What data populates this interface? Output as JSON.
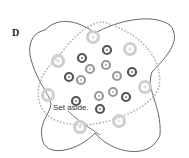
{
  "panel": {
    "label": "D"
  },
  "annotation": {
    "text": "Set aside."
  },
  "colors": {
    "outline": "#555555",
    "dotted": "#b5b5b5",
    "dark": "#555555",
    "medium": "#9a9a9a",
    "light": "#cfcfcf"
  },
  "circles": [
    {
      "x": 93,
      "y": 37,
      "r": 5.5,
      "tone": "light"
    },
    {
      "x": 130,
      "y": 49,
      "r": 5.5,
      "tone": "light"
    },
    {
      "x": 58,
      "y": 61,
      "r": 5.5,
      "tone": "light"
    },
    {
      "x": 48,
      "y": 95,
      "r": 5.5,
      "tone": "light"
    },
    {
      "x": 145,
      "y": 87,
      "r": 5.5,
      "tone": "light"
    },
    {
      "x": 119,
      "y": 121,
      "r": 5.5,
      "tone": "light"
    },
    {
      "x": 80,
      "y": 127,
      "r": 5.5,
      "tone": "light"
    },
    {
      "x": 82,
      "y": 58,
      "r": 4,
      "tone": "dark"
    },
    {
      "x": 107,
      "y": 50,
      "r": 4,
      "tone": "dark"
    },
    {
      "x": 69,
      "y": 77,
      "r": 4,
      "tone": "dark"
    },
    {
      "x": 132,
      "y": 72,
      "r": 4,
      "tone": "dark"
    },
    {
      "x": 76,
      "y": 101,
      "r": 4,
      "tone": "dark"
    },
    {
      "x": 100,
      "y": 109,
      "r": 4,
      "tone": "dark"
    },
    {
      "x": 126,
      "y": 97,
      "r": 4,
      "tone": "dark"
    },
    {
      "x": 90,
      "y": 69,
      "r": 4,
      "tone": "medium"
    },
    {
      "x": 106,
      "y": 65,
      "r": 4,
      "tone": "medium"
    },
    {
      "x": 81,
      "y": 80,
      "r": 4,
      "tone": "medium"
    },
    {
      "x": 117,
      "y": 76,
      "r": 4,
      "tone": "medium"
    },
    {
      "x": 113,
      "y": 92,
      "r": 4,
      "tone": "medium"
    },
    {
      "x": 99,
      "y": 96,
      "r": 4,
      "tone": "medium"
    }
  ]
}
